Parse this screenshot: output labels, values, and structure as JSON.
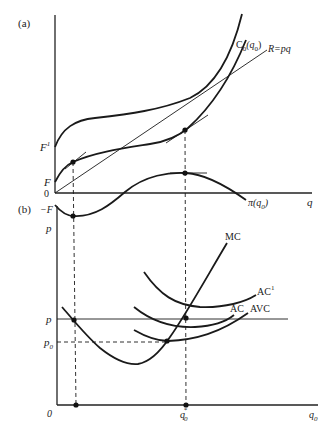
{
  "figure": {
    "panel_a": {
      "label": "(a)",
      "y_labels": {
        "F1": "F",
        "F1_sup": "1",
        "F": "F",
        "zero": "0"
      },
      "x_axis_label": "q",
      "curves": {
        "cost": {
          "label_main": "C",
          "label_sub": "0",
          "label_arg_open": "(q",
          "label_arg_sub": "0",
          "label_close": ")"
        },
        "revenue": {
          "label": "R=pq"
        },
        "profit": {
          "label_main": "π(q",
          "label_sub": "0",
          "label_close": ")"
        }
      }
    },
    "panel_b": {
      "label": "(b)",
      "y_labels": {
        "neg_F": "−F",
        "p_axis": "p",
        "p": "p",
        "p0_main": "p",
        "p0_sub": "0",
        "zero": "0"
      },
      "x_labels": {
        "qstar_main": "q",
        "qstar_sub": "0",
        "qstar_sup": "*",
        "q0_main": "q",
        "q0_sub": "0"
      },
      "curves": {
        "mc": "MC",
        "ac1_main": "AC",
        "ac1_sup": "1",
        "ac": "AC",
        "avc": "AVC"
      }
    }
  },
  "colors": {
    "ink": "#1a1a1a",
    "background": "#ffffff"
  }
}
